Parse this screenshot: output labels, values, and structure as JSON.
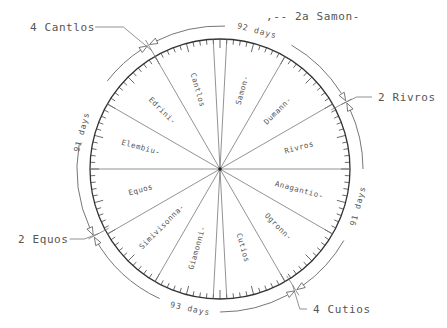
{
  "diagram": {
    "type": "calendar-wheel",
    "center": [
      220,
      169
    ],
    "rim_radius": 130,
    "outer_arc_radius": 143,
    "tick_count": 120,
    "spoke_angles_deg": [
      -3,
      3,
      30,
      60,
      90,
      120,
      150,
      177,
      183,
      210,
      240,
      270,
      300,
      330
    ],
    "sectors": [
      {
        "label": "Samon-",
        "angle": 16
      },
      {
        "label": "Dumann-",
        "angle": 45
      },
      {
        "label": "Rivros",
        "angle": 75
      },
      {
        "label": "Anagantio-",
        "angle": 105
      },
      {
        "label": "Ogronn-",
        "angle": 135
      },
      {
        "label": "Cutios",
        "angle": 164
      },
      {
        "label": "Giamonni-",
        "angle": 196
      },
      {
        "label": "Simivisonna-",
        "angle": 225
      },
      {
        "label": "Equos",
        "angle": 255
      },
      {
        "label": "Elembiu-",
        "angle": 285
      },
      {
        "label": "Edrini-",
        "angle": 315
      },
      {
        "label": "Cantlos",
        "angle": 344
      }
    ],
    "quarter_markers": [
      {
        "label": "4 Cantlos",
        "angle": -30,
        "text_x": 30,
        "text_y": 31
      },
      {
        "label": "2 Rivros",
        "angle": 62,
        "text_x": 378,
        "text_y": 101
      },
      {
        "label": "4 Cutios",
        "angle": 148,
        "text_x": 313,
        "text_y": 313
      },
      {
        "label": "2 Equos",
        "angle": -118,
        "text_x": 18,
        "text_y": 243
      }
    ],
    "intercalary_note": {
      "label": "2a Samon-",
      "prefix": ",--",
      "text_x": 288,
      "text_y": 20
    },
    "quarter_lengths": [
      {
        "label": "92 days",
        "angle": 15
      },
      {
        "label": "91 days",
        "angle": 105
      },
      {
        "label": "93 days",
        "angle": 192
      },
      {
        "label": "91 days",
        "angle": 285
      }
    ]
  }
}
